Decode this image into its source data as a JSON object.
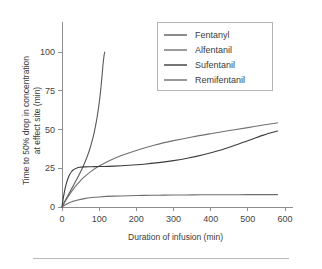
{
  "chart_data": {
    "type": "line",
    "title": "",
    "subtitle": "",
    "xlabel": "Duration of infusion (min)",
    "ylabel": "Time to 50% drop in concentration at effect site (min)",
    "ylabel_line1": "Time to 50% drop in concentration",
    "ylabel_line2": "at effect site (min)",
    "xlim": [
      0,
      600
    ],
    "ylim": [
      0,
      115
    ],
    "xticks": [
      0,
      100,
      200,
      300,
      400,
      500,
      600
    ],
    "xticklabels": [
      "0",
      "100",
      "200",
      "300",
      "400",
      "500",
      "600"
    ],
    "yticks": [
      0,
      25,
      50,
      75,
      100
    ],
    "yticklabels": [
      "0",
      "25",
      "50",
      "75",
      "100"
    ],
    "grid": false,
    "legend_position": "upper right",
    "series": [
      {
        "name": "Fentanyl",
        "color": "#5a5a5a",
        "x": [
          0,
          5,
          10,
          15,
          20,
          25,
          30,
          35,
          40,
          45,
          50,
          55,
          60,
          65,
          70,
          75,
          80,
          85,
          90,
          95,
          100,
          105,
          110,
          113,
          115
        ],
        "values": [
          0,
          2.5,
          4.8,
          7.0,
          9.2,
          11.4,
          13.6,
          15.8,
          18.0,
          20.3,
          22.7,
          25.2,
          27.9,
          30.8,
          34.0,
          37.6,
          41.7,
          46.4,
          52.0,
          58.8,
          67.0,
          77.5,
          91.0,
          97.5,
          100
        ]
      },
      {
        "name": "Alfentanil",
        "color": "#707070",
        "x": [
          0,
          10,
          20,
          30,
          40,
          50,
          60,
          80,
          100,
          130,
          160,
          200,
          250,
          300,
          350,
          400,
          450,
          500,
          550,
          580
        ],
        "values": [
          0,
          4.2,
          8.0,
          11.4,
          14.4,
          17.0,
          19.4,
          23.3,
          26.4,
          30.2,
          33.2,
          36.5,
          40.0,
          42.8,
          45.2,
          47.3,
          49.3,
          51.2,
          53.2,
          54.3
        ]
      },
      {
        "name": "Sufentanil",
        "color": "#3c3c3c",
        "x": [
          0,
          4,
          8,
          12,
          16,
          20,
          25,
          30,
          40,
          50,
          60,
          80,
          100,
          140,
          180,
          220,
          260,
          300,
          340,
          380,
          420,
          460,
          500,
          540,
          580
        ],
        "values": [
          0,
          6.5,
          11.5,
          15.4,
          18.4,
          20.6,
          22.6,
          23.9,
          25.2,
          25.7,
          25.9,
          26.0,
          26.1,
          26.4,
          26.9,
          27.6,
          28.6,
          29.9,
          31.6,
          33.7,
          36.3,
          39.4,
          42.8,
          46.2,
          49.0
        ]
      },
      {
        "name": "Remifentanil",
        "color": "#6e6e6e",
        "x": [
          0,
          10,
          20,
          30,
          40,
          60,
          80,
          100,
          140,
          180,
          220,
          260,
          300,
          350,
          400,
          450,
          500,
          550,
          580
        ],
        "values": [
          0,
          1.6,
          2.8,
          3.7,
          4.4,
          5.4,
          6.1,
          6.5,
          7.0,
          7.3,
          7.5,
          7.6,
          7.7,
          7.8,
          7.9,
          7.9,
          8.0,
          8.0,
          8.0
        ]
      }
    ]
  },
  "legend": {
    "entries": [
      {
        "label": "Fentanyl"
      },
      {
        "label": "Alfentanil"
      },
      {
        "label": "Sufentanil"
      },
      {
        "label": "Remifentanil"
      }
    ]
  }
}
